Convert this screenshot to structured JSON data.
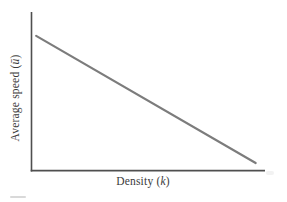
{
  "figure": {
    "y_axis_label": {
      "prefix": "Average speed (",
      "symbol": "ū",
      "suffix": ")"
    },
    "x_axis_label": {
      "prefix": "Density (",
      "symbol": "k",
      "suffix": ")"
    }
  },
  "colors": {
    "axis": "#4f4f4f",
    "data_line": "#7c7c7c",
    "text": "#3b3b3b",
    "background": "#ffffff"
  },
  "chart_data": {
    "type": "line",
    "title": "",
    "xlabel": "Density (k)",
    "ylabel": "Average speed (ū)",
    "grid": false,
    "legend": null,
    "x_tick_labels": [],
    "y_tick_labels": [],
    "series": [
      {
        "name": "average-speed-vs-density",
        "relationship": "linear decreasing",
        "points_axis_fraction": [
          [
            0.02,
            0.85
          ],
          [
            0.96,
            0.05
          ]
        ]
      }
    ]
  }
}
